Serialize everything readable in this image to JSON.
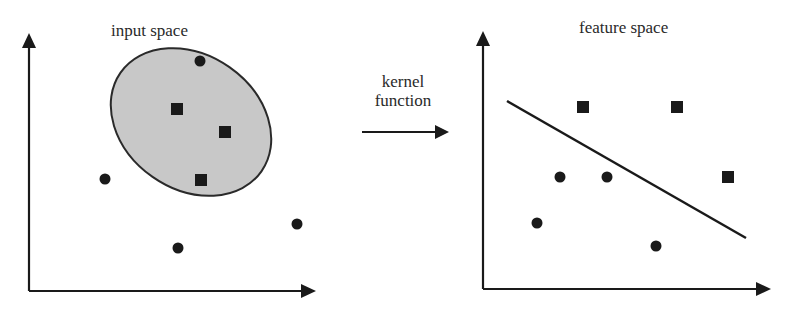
{
  "diagram": {
    "input_panel": {
      "title": "input space",
      "ellipse": {
        "cx": 191,
        "cy": 122,
        "rx": 86,
        "ry": 67,
        "rotation_deg": 35,
        "fill": "#c8c8c8",
        "stroke": "#2a2a2a"
      },
      "circles": [
        {
          "x": 200,
          "y": 61
        },
        {
          "x": 105,
          "y": 179
        },
        {
          "x": 178,
          "y": 248
        },
        {
          "x": 297,
          "y": 224
        }
      ],
      "squares": [
        {
          "x": 177,
          "y": 109
        },
        {
          "x": 225,
          "y": 132
        },
        {
          "x": 201,
          "y": 180
        }
      ]
    },
    "transform": {
      "line1": "kernel",
      "line2": "function"
    },
    "feature_panel": {
      "title": "feature space",
      "separator": {
        "x1": 507,
        "y1": 101,
        "x2": 746,
        "y2": 238
      },
      "circles": [
        {
          "x": 560,
          "y": 177
        },
        {
          "x": 607,
          "y": 177
        },
        {
          "x": 537,
          "y": 223
        },
        {
          "x": 656,
          "y": 246
        }
      ],
      "squares": [
        {
          "x": 583,
          "y": 107
        },
        {
          "x": 677,
          "y": 107
        },
        {
          "x": 728,
          "y": 177
        }
      ]
    },
    "colors": {
      "ink": "#1a1a1a",
      "ellipse_fill": "#c8c8c8",
      "background": "#ffffff"
    }
  }
}
